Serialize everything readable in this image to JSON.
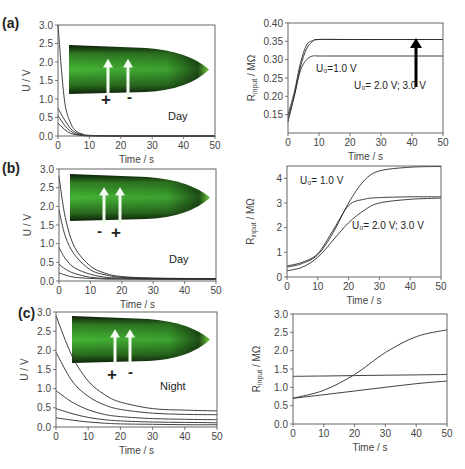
{
  "figure": {
    "panels": [
      {
        "id": "a",
        "label": "(a)",
        "condition": "Day",
        "electrode_left": "+",
        "electrode_right": "-"
      },
      {
        "id": "b",
        "label": "(b)",
        "condition": "Day",
        "electrode_left": "-",
        "electrode_right": "+"
      },
      {
        "id": "c",
        "label": "(c)",
        "condition": "Night",
        "electrode_left": "+",
        "electrode_right": "-"
      }
    ],
    "annotations": {
      "a_right_u1": "U₀=1.0 V",
      "a_right_u23": "U₀= 2.0 V; 3.0 V",
      "b_right_u1": "U₀= 1.0 V",
      "b_right_u23": "U₀= 2.0 V; 3.0 V"
    }
  },
  "chart_data": [
    {
      "id": "a-left",
      "type": "line",
      "title": "",
      "panel": "(a)",
      "xlabel": "Time / s",
      "ylabel": "U / V",
      "xlim": [
        0,
        50
      ],
      "ylim": [
        0,
        3.0
      ],
      "xticks": [
        0,
        10,
        20,
        30,
        40,
        50
      ],
      "yticks": [
        "0.0",
        "0.5",
        "1.0",
        "1.5",
        "2.0",
        "2.5",
        "3.0"
      ],
      "grid": false,
      "annotations": [
        "Day",
        "+",
        "-"
      ],
      "series": [
        {
          "name": "U0=3.0 V",
          "x": [
            0,
            2,
            4,
            6,
            8,
            10,
            20,
            50
          ],
          "values": [
            3.0,
            1.0,
            0.35,
            0.12,
            0.05,
            0.02,
            0.0,
            0.0
          ]
        },
        {
          "name": "U0=2.0 V",
          "x": [
            0,
            2,
            4,
            6,
            8,
            10,
            20,
            50
          ],
          "values": [
            0.75,
            0.45,
            0.2,
            0.08,
            0.03,
            0.01,
            0.0,
            0.0
          ]
        },
        {
          "name": "U0=1.0 V",
          "x": [
            0,
            2,
            4,
            6,
            8,
            10,
            20,
            50
          ],
          "values": [
            0.55,
            0.3,
            0.13,
            0.05,
            0.02,
            0.01,
            0.0,
            0.0
          ]
        },
        {
          "name": "U0=0.5 V",
          "x": [
            0,
            2,
            4,
            6,
            8,
            10,
            20,
            50
          ],
          "values": [
            0.35,
            0.18,
            0.07,
            0.03,
            0.01,
            0.0,
            0.0,
            0.0
          ]
        }
      ]
    },
    {
      "id": "a-right",
      "type": "line",
      "title": "",
      "panel": "(a)",
      "xlabel": "Time / s",
      "ylabel": "R_input / MΩ",
      "xlim": [
        0,
        50
      ],
      "ylim": [
        0.1,
        0.4
      ],
      "xticks": [
        0,
        10,
        20,
        30,
        40,
        50
      ],
      "yticks": [
        "0.15",
        "0.20",
        "0.25",
        "0.30",
        "0.35",
        "0.40"
      ],
      "grid": false,
      "annotations": [
        "U₀=1.0 V",
        "U₀= 2.0 V; 3.0 V",
        "arrow-up at t≈41"
      ],
      "series": [
        {
          "name": "U0=1.0 V",
          "x": [
            0,
            2,
            4,
            6,
            8,
            10,
            20,
            50
          ],
          "values": [
            0.14,
            0.2,
            0.27,
            0.3,
            0.31,
            0.31,
            0.31,
            0.31
          ]
        },
        {
          "name": "U0=2.0 V",
          "x": [
            0,
            2,
            4,
            6,
            8,
            10,
            20,
            50
          ],
          "values": [
            0.13,
            0.2,
            0.28,
            0.33,
            0.35,
            0.355,
            0.355,
            0.355
          ]
        },
        {
          "name": "U0=3.0 V",
          "x": [
            0,
            2,
            4,
            6,
            8,
            10,
            20,
            50
          ],
          "values": [
            0.15,
            0.21,
            0.29,
            0.34,
            0.352,
            0.355,
            0.355,
            0.355
          ]
        }
      ]
    },
    {
      "id": "b-left",
      "type": "line",
      "title": "",
      "panel": "(b)",
      "xlabel": "Time / s",
      "ylabel": "U / V",
      "xlim": [
        0,
        50
      ],
      "ylim": [
        0,
        3.0
      ],
      "xticks": [
        0,
        10,
        20,
        30,
        40,
        50
      ],
      "yticks": [
        "0.0",
        "0.5",
        "1.0",
        "1.5",
        "2.0",
        "2.5",
        "3.0"
      ],
      "grid": false,
      "annotations": [
        "Day",
        "-",
        "+"
      ],
      "series": [
        {
          "name": "U0=3.0 V",
          "x": [
            0,
            2,
            5,
            10,
            15,
            20,
            30,
            50
          ],
          "values": [
            2.8,
            1.7,
            0.9,
            0.4,
            0.2,
            0.12,
            0.08,
            0.06
          ]
        },
        {
          "name": "U0=2.0 V",
          "x": [
            0,
            2,
            5,
            10,
            15,
            20,
            30,
            50
          ],
          "values": [
            1.9,
            1.2,
            0.7,
            0.3,
            0.16,
            0.1,
            0.07,
            0.06
          ]
        },
        {
          "name": "U0=1.0 V",
          "x": [
            0,
            2,
            5,
            10,
            15,
            20,
            30,
            50
          ],
          "values": [
            0.9,
            0.6,
            0.35,
            0.18,
            0.1,
            0.08,
            0.06,
            0.05
          ]
        },
        {
          "name": "U0=0.5 V",
          "x": [
            0,
            2,
            5,
            10,
            15,
            20,
            30,
            50
          ],
          "values": [
            0.45,
            0.32,
            0.2,
            0.1,
            0.07,
            0.06,
            0.05,
            0.05
          ]
        },
        {
          "name": "U0=0.25 V",
          "x": [
            0,
            2,
            5,
            10,
            15,
            20,
            30,
            50
          ],
          "values": [
            0.22,
            0.16,
            0.1,
            0.07,
            0.05,
            0.05,
            0.05,
            0.05
          ]
        }
      ]
    },
    {
      "id": "b-right",
      "type": "line",
      "title": "",
      "panel": "(b)",
      "xlabel": "Time / s",
      "ylabel": "R_input / MΩ",
      "xlim": [
        0,
        50
      ],
      "ylim": [
        0,
        4.5
      ],
      "xticks": [
        0,
        10,
        20,
        30,
        40,
        50
      ],
      "yticks": [
        "0",
        "1",
        "2",
        "3",
        "4"
      ],
      "grid": false,
      "annotations": [
        "U₀= 1.0 V",
        "U₀= 2.0 V; 3.0 V"
      ],
      "series": [
        {
          "name": "U0=1.0 V",
          "x": [
            0,
            5,
            10,
            15,
            20,
            25,
            30,
            40,
            50
          ],
          "values": [
            0.4,
            0.55,
            0.9,
            1.8,
            3.0,
            3.9,
            4.3,
            4.45,
            4.48
          ]
        },
        {
          "name": "U0=2.0 V",
          "x": [
            0,
            5,
            10,
            15,
            20,
            25,
            30,
            40,
            50
          ],
          "values": [
            0.45,
            0.6,
            0.95,
            1.9,
            2.9,
            3.15,
            3.22,
            3.25,
            3.25
          ]
        },
        {
          "name": "U0=3.0 V",
          "x": [
            0,
            5,
            10,
            15,
            20,
            25,
            30,
            40,
            50
          ],
          "values": [
            0.25,
            0.4,
            0.8,
            1.5,
            2.2,
            2.7,
            3.0,
            3.15,
            3.2
          ]
        }
      ]
    },
    {
      "id": "c-left",
      "type": "line",
      "title": "",
      "panel": "(c)",
      "xlabel": "Time / s",
      "ylabel": "U / V",
      "xlim": [
        0,
        50
      ],
      "ylim": [
        0,
        3.0
      ],
      "xticks": [
        0,
        10,
        20,
        30,
        40,
        50
      ],
      "yticks": [
        "0.0",
        "0.5",
        "1.0",
        "1.5",
        "2.0",
        "2.5",
        "3.0"
      ],
      "grid": false,
      "annotations": [
        "Night",
        "+",
        "-"
      ],
      "series": [
        {
          "name": "U0=3.0 V",
          "x": [
            0,
            5,
            10,
            15,
            20,
            30,
            40,
            50
          ],
          "values": [
            2.9,
            1.85,
            1.2,
            0.85,
            0.65,
            0.48,
            0.44,
            0.42
          ]
        },
        {
          "name": "U0=2.0 V",
          "x": [
            0,
            5,
            10,
            15,
            20,
            30,
            40,
            50
          ],
          "values": [
            1.95,
            1.2,
            0.8,
            0.58,
            0.46,
            0.36,
            0.33,
            0.32
          ]
        },
        {
          "name": "U0=1.0 V",
          "x": [
            0,
            5,
            10,
            15,
            20,
            30,
            40,
            50
          ],
          "values": [
            0.95,
            0.65,
            0.45,
            0.33,
            0.27,
            0.22,
            0.2,
            0.19
          ]
        },
        {
          "name": "U0=0.5 V",
          "x": [
            0,
            5,
            10,
            15,
            20,
            30,
            40,
            50
          ],
          "values": [
            0.48,
            0.35,
            0.25,
            0.19,
            0.16,
            0.13,
            0.12,
            0.11
          ]
        },
        {
          "name": "U0=0.25 V",
          "x": [
            0,
            5,
            10,
            15,
            20,
            30,
            40,
            50
          ],
          "values": [
            0.24,
            0.18,
            0.13,
            0.1,
            0.08,
            0.07,
            0.06,
            0.06
          ]
        }
      ]
    },
    {
      "id": "c-right",
      "type": "line",
      "title": "",
      "panel": "(c)",
      "xlabel": "Time / s",
      "ylabel": "R_input / MΩ",
      "xlim": [
        0,
        50
      ],
      "ylim": [
        0,
        3.0
      ],
      "xticks": [
        0,
        10,
        20,
        30,
        40,
        50
      ],
      "yticks": [
        "0.0",
        "0.5",
        "1.0",
        "1.5",
        "2.0",
        "2.5",
        "3.0"
      ],
      "grid": false,
      "annotations": [],
      "series": [
        {
          "name": "curve-1",
          "x": [
            0,
            10,
            20,
            30,
            40,
            50
          ],
          "values": [
            0.7,
            0.92,
            1.35,
            1.95,
            2.38,
            2.57
          ]
        },
        {
          "name": "curve-2",
          "x": [
            0,
            10,
            20,
            30,
            40,
            50
          ],
          "values": [
            1.3,
            1.31,
            1.32,
            1.33,
            1.34,
            1.35
          ]
        },
        {
          "name": "curve-3",
          "x": [
            0,
            10,
            20,
            30,
            40,
            50
          ],
          "values": [
            0.7,
            0.8,
            0.9,
            1.0,
            1.1,
            1.17
          ]
        }
      ]
    }
  ]
}
